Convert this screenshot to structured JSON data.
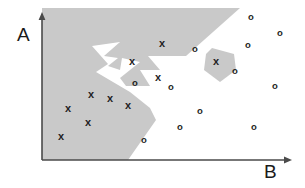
{
  "figure": {
    "width": 305,
    "height": 188,
    "background_color": "#ffffff"
  },
  "axes": {
    "y_label": "A",
    "x_label": "B",
    "axis_color": "#4a4a4a",
    "origin_x": 42,
    "origin_y": 160,
    "y_top": 12,
    "x_right": 292
  },
  "region": {
    "name": "class-x-decision-region",
    "fill_color": "#c9c9c9",
    "main_polygon": "42,8 240,8 186,56 148,56 160,70 140,70 150,86 126,86 120,78 140,62 122,58 120,70 108,66 118,58 104,56 120,42 92,46 108,64 96,72 130,92 150,108 156,120 128,160 42,160",
    "island_polygon": "212,48 234,54 236,70 220,82 204,70 206,54"
  },
  "chart_data": {
    "type": "scatter",
    "title": "",
    "xlabel": "B",
    "ylabel": "A",
    "grid": false,
    "legend": "none",
    "marker_glyphs": {
      "class_x": "x",
      "class_o": "o"
    },
    "series": [
      {
        "name": "x",
        "glyph": "x",
        "color": "#1f1f1f",
        "points": [
          [
            162,
            43
          ],
          [
            132,
            61
          ],
          [
            158,
            77
          ],
          [
            216,
            61
          ],
          [
            91,
            94
          ],
          [
            110,
            98
          ],
          [
            68,
            108
          ],
          [
            128,
            105
          ],
          [
            88,
            122
          ],
          [
            61,
            136
          ]
        ]
      },
      {
        "name": "o",
        "glyph": "o",
        "color": "#1f1f1f",
        "points": [
          [
            251,
            16
          ],
          [
            280,
            32
          ],
          [
            195,
            48
          ],
          [
            248,
            44
          ],
          [
            135,
            82
          ],
          [
            171,
            86
          ],
          [
            235,
            70
          ],
          [
            200,
            110
          ],
          [
            275,
            85
          ],
          [
            180,
            126
          ],
          [
            144,
            139
          ],
          [
            254,
            126
          ]
        ]
      }
    ]
  }
}
